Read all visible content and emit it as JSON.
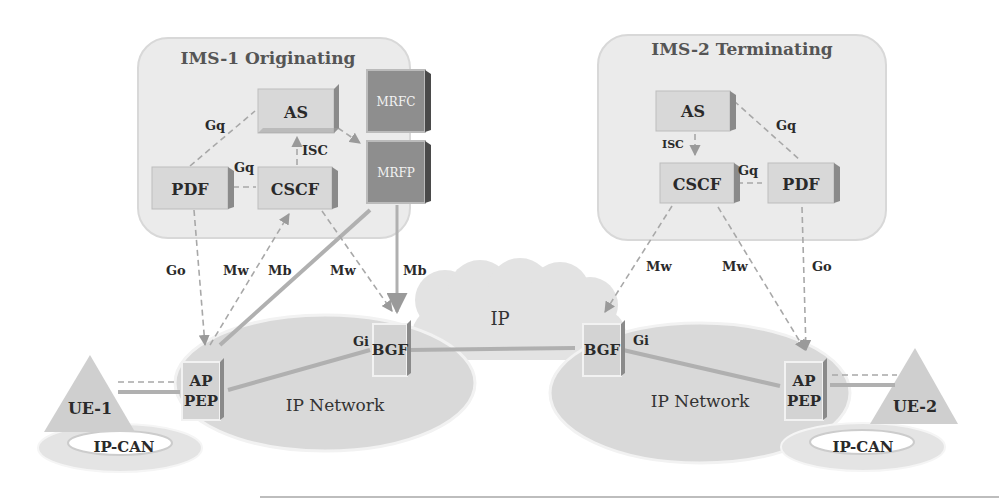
{
  "domains": {
    "originating": {
      "title": "IMS-1 Originating"
    },
    "terminating": {
      "title": "IMS-2 Terminating"
    }
  },
  "nodes": {
    "as1": "AS",
    "pdf1": "PDF",
    "cscf1": "CSCF",
    "mrfc": "MRFC",
    "mrfp": "MRFP",
    "as2": "AS",
    "cscf2": "CSCF",
    "pdf2": "PDF",
    "bgf1": "BGF",
    "bgf2": "BGF",
    "ap_pep1_line1": "AP",
    "ap_pep1_line2": "PEP",
    "ap_pep2_line1": "AP",
    "ap_pep2_line2": "PEP",
    "ue1": "UE-1",
    "ue2": "UE-2"
  },
  "networks": {
    "ip_cloud": "IP",
    "ip_network_left": "IP Network",
    "ip_network_right": "IP Network",
    "ipcan_left": "IP-CAN",
    "ipcan_right": "IP-CAN"
  },
  "interfaces": {
    "gq_as_pdf_1": "Gq",
    "gq_pdf_cscf_1": "Gq",
    "isc_1": "ISC",
    "go_1": "Go",
    "mw_1a": "Mw",
    "mb_1a": "Mb",
    "mw_1b": "Mw",
    "mb_1b": "Mb",
    "gi_1": "Gi",
    "gq_as_pdf_2": "Gq",
    "gq_cscf_pdf_2": "Gq",
    "isc_2": "ISC",
    "mw_2a": "Mw",
    "mw_2b": "Mw",
    "go_2": "Go",
    "gi_2": "Gi"
  },
  "colors": {
    "domain_fill": "#ededed",
    "box_fill": "#d6d6d6",
    "box_dark": "#8e8e8e",
    "box_edge": "#5a5a5a",
    "network_fill": "#d9d9d9",
    "link": "#a8a8a8"
  }
}
